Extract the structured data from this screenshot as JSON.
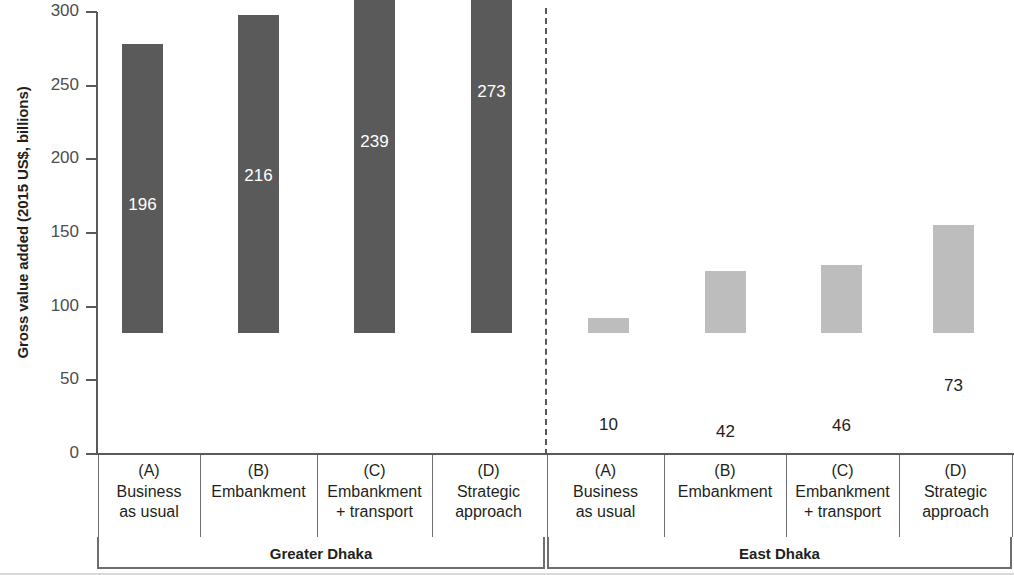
{
  "chart_data": {
    "type": "bar",
    "title": "",
    "xlabel": "",
    "ylabel": "Gross value added (2015 US$, billions)",
    "ylim": [
      0,
      300
    ],
    "ytick_labels": [
      "300",
      "250",
      "200",
      "150",
      "100",
      "50",
      "0"
    ],
    "ytick_values": [
      300,
      250,
      200,
      150,
      100,
      50,
      0
    ],
    "grid": false,
    "legend": "none",
    "group_divider": "dashed vertical line between Greater Dhaka and East Dhaka",
    "categories": [
      "(A) Business as usual",
      "(B) Embankment",
      "(C) Embankment + transport",
      "(D) Strategic approach"
    ],
    "series": [
      {
        "name": "Greater Dhaka",
        "values": [
          196,
          216,
          239,
          273
        ],
        "color": "#5a5a5a"
      },
      {
        "name": "East Dhaka",
        "values": [
          10,
          42,
          46,
          73
        ],
        "color": "#bdbdbd"
      }
    ],
    "groups": [
      {
        "name": "Greater Dhaka",
        "bar_color": "#5a5a5a",
        "value_text_color": "#ffffff",
        "bars": [
          {
            "code": "(A)",
            "line1": "Business",
            "line2": "as usual",
            "value": 196,
            "value_label": "196"
          },
          {
            "code": "(B)",
            "line1": "Embankment",
            "line2": "",
            "value": 216,
            "value_label": "216"
          },
          {
            "code": "(C)",
            "line1": "Embankment",
            "line2": "+ transport",
            "value": 239,
            "value_label": "239"
          },
          {
            "code": "(D)",
            "line1": "Strategic",
            "line2": "approach",
            "value": 273,
            "value_label": "273"
          }
        ]
      },
      {
        "name": "East Dhaka",
        "bar_color": "#bdbdbd",
        "value_text_color": "#231f20",
        "bars": [
          {
            "code": "(A)",
            "line1": "Business",
            "line2": "as usual",
            "value": 10,
            "value_label": "10"
          },
          {
            "code": "(B)",
            "line1": "Embankment",
            "line2": "",
            "value": 42,
            "value_label": "42"
          },
          {
            "code": "(C)",
            "line1": "Embankment",
            "line2": "+ transport",
            "value": 46,
            "value_label": "46"
          },
          {
            "code": "(D)",
            "line1": "Strategic",
            "line2": "approach",
            "value": 73,
            "value_label": "73"
          }
        ]
      }
    ]
  },
  "axis": {
    "y_title": "Gross value added (2015 US$, billions)",
    "ticks": [
      {
        "label": "300",
        "value": 300
      },
      {
        "label": "250",
        "value": 250
      },
      {
        "label": "200",
        "value": 200
      },
      {
        "label": "150",
        "value": 150
      },
      {
        "label": "100",
        "value": 100
      },
      {
        "label": "50",
        "value": 50
      },
      {
        "label": "0",
        "value": 0
      }
    ]
  },
  "groups": [
    {
      "label": "Greater Dhaka"
    },
    {
      "label": "East Dhaka"
    }
  ]
}
